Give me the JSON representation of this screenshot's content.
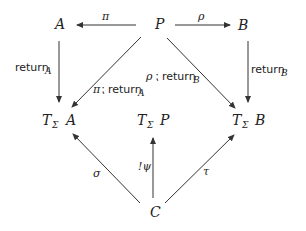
{
  "nodes": {
    "A": {
      "label": "A"
    },
    "P": {
      "label": "P"
    },
    "B": {
      "label": "B"
    },
    "TA": {
      "functor": "T",
      "sub": "Σ",
      "arg": "A"
    },
    "TP": {
      "functor": "T",
      "sub": "Σ",
      "arg": "P"
    },
    "TB": {
      "functor": "T",
      "sub": "Σ",
      "arg": "B"
    },
    "C": {
      "label": "C"
    }
  },
  "edges": {
    "pi": {
      "from": "P",
      "to": "A",
      "label": "π"
    },
    "rho": {
      "from": "P",
      "to": "B",
      "label": "ρ"
    },
    "returnA": {
      "from": "A",
      "to": "TA",
      "label": "return",
      "sub": "A"
    },
    "returnB": {
      "from": "B",
      "to": "TB",
      "label": "return",
      "sub": "B"
    },
    "piReturnA": {
      "from": "P",
      "to": "TA",
      "prefix": "π",
      "sep": "⁏",
      "label": "return",
      "sub": "A"
    },
    "rhoReturnB": {
      "from": "P",
      "to": "TB",
      "prefix": "ρ",
      "sep": "⁏",
      "label": "return",
      "sub": "B"
    },
    "sigma": {
      "from": "C",
      "to": "TA",
      "label": "σ"
    },
    "psi": {
      "from": "C",
      "to": "TP",
      "label": "!ψ"
    },
    "tau": {
      "from": "C",
      "to": "TB",
      "label": "τ"
    }
  }
}
